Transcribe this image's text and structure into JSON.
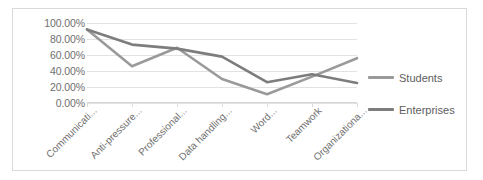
{
  "chart_data": {
    "type": "line",
    "title": "",
    "xlabel": "",
    "ylabel": "",
    "ylim": [
      0,
      100
    ],
    "ytick_labels": [
      "100.00%",
      "80.00%",
      "60.00%",
      "40.00%",
      "20.00%",
      "0.00%"
    ],
    "ytick_values": [
      100,
      80,
      60,
      40,
      20,
      0
    ],
    "grid": true,
    "legend_position": "right",
    "categories": [
      "Communicati...",
      "Anti-pressure...",
      "Professional...",
      "Data handling...",
      "Word...",
      "Teamwork",
      "Organizationa..."
    ],
    "series": [
      {
        "name": "Students",
        "color": "#9a9a9a",
        "values": [
          92,
          46,
          69,
          30,
          11,
          33,
          56
        ]
      },
      {
        "name": "Enterprises",
        "color": "#7d7d7d",
        "values": [
          92,
          73,
          68,
          58,
          26,
          36,
          25
        ]
      }
    ]
  }
}
